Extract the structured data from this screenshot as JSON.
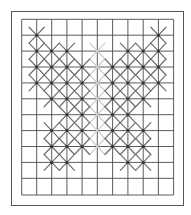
{
  "diagram": {
    "type": "cross-stitch-grid",
    "frame": {
      "x": 11,
      "y": 11,
      "width": 172,
      "height": 194,
      "color": "#555555"
    },
    "grid": {
      "x_lines": [
        21.7,
        36.7,
        51.7,
        66.9,
        82.1,
        97.3,
        112.6,
        127.9,
        143.2,
        158.4,
        173.6
      ],
      "y_lines": [
        19.3,
        35.2,
        51.1,
        67.0,
        82.9,
        98.8,
        114.7,
        130.6,
        146.5,
        162.4,
        178.3,
        195.0
      ],
      "color": "#4a4a4a"
    },
    "stitch_color": "#6e6e6e",
    "faint_stitch_color": "#d2d2d2",
    "dot_color": "#333333",
    "stitches": [
      {
        "row": 1,
        "cols": [
          1,
          9
        ]
      },
      {
        "row": 2,
        "cols": [
          1,
          2,
          3,
          7,
          8,
          9
        ]
      },
      {
        "row": 3,
        "cols": [
          1,
          2,
          3,
          4,
          6,
          7,
          8,
          9
        ]
      },
      {
        "row": 4,
        "cols": [
          1,
          2,
          3,
          4,
          6,
          7,
          8,
          9
        ]
      },
      {
        "row": 5,
        "cols": [
          2,
          3,
          4,
          6,
          7,
          8
        ]
      },
      {
        "row": 6,
        "cols": [
          3,
          4,
          6,
          7
        ]
      },
      {
        "row": 7,
        "cols": [
          2,
          3,
          4,
          6,
          7,
          8
        ]
      },
      {
        "row": 8,
        "cols": [
          2,
          3,
          4,
          6,
          7,
          8
        ]
      },
      {
        "row": 9,
        "cols": [
          2,
          3,
          7,
          8
        ]
      }
    ],
    "faint_stitches": [
      {
        "row": 2,
        "cols": [
          5
        ]
      },
      {
        "row": 3,
        "cols": [
          5
        ]
      },
      {
        "row": 4,
        "cols": [
          5
        ]
      },
      {
        "row": 5,
        "cols": [
          5
        ]
      },
      {
        "row": 6,
        "cols": [
          5
        ]
      },
      {
        "row": 7,
        "cols": [
          5
        ]
      },
      {
        "row": 8,
        "cols": [
          5
        ]
      }
    ]
  }
}
